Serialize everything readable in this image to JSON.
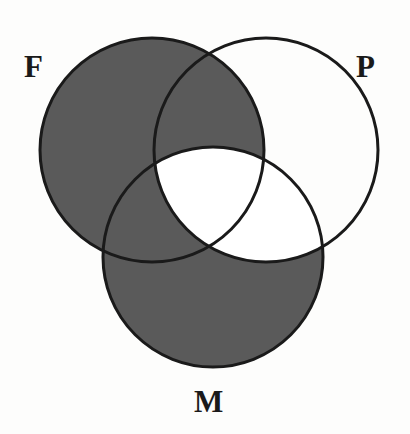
{
  "figure": {
    "type": "venn-3",
    "background_color": "#fdfdfc",
    "shade_color": "#5a5a5a",
    "unshaded_color": "#ffffff",
    "outline_color": "#1a1a1a",
    "outline_width": 3,
    "label_color": "#1a1a1a"
  },
  "sets": [
    {
      "id": "F",
      "label": "F",
      "label_position": "top-left",
      "center": {
        "x": 152,
        "y": 150
      },
      "radius": 112
    },
    {
      "id": "P",
      "label": "P",
      "label_position": "top-right",
      "center": {
        "x": 266,
        "y": 150
      },
      "radius": 112
    },
    {
      "id": "M",
      "label": "M",
      "label_position": "bottom-center",
      "center": {
        "x": 213,
        "y": 257
      },
      "radius": 110
    }
  ],
  "regions": [
    {
      "id": "F-only",
      "sets": [
        "F"
      ],
      "shaded": true,
      "description": "F only"
    },
    {
      "id": "P-only",
      "sets": [
        "P"
      ],
      "shaded": false,
      "description": "P only"
    },
    {
      "id": "M-only",
      "sets": [
        "M"
      ],
      "shaded": true,
      "description": "M only"
    },
    {
      "id": "FP",
      "sets": [
        "F",
        "P"
      ],
      "shaded": true,
      "description": "F and P, not M"
    },
    {
      "id": "FM",
      "sets": [
        "F",
        "M"
      ],
      "shaded": true,
      "description": "F and M, not P"
    },
    {
      "id": "PM",
      "sets": [
        "P",
        "M"
      ],
      "shaded": false,
      "description": "P and M, not F"
    },
    {
      "id": "FPM",
      "sets": [
        "F",
        "P",
        "M"
      ],
      "shaded": false,
      "description": "F and P and M"
    }
  ],
  "shaded_region_count": 4,
  "unshaded_region_count": 3
}
